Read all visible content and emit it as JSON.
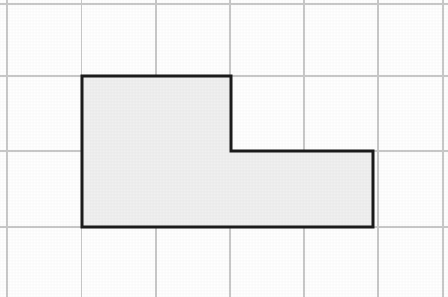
{
  "figure": {
    "canvas": {
      "width": 448,
      "height": 297
    },
    "background_color": "#ffffff"
  },
  "grid": {
    "line_color": "#c9c9c9",
    "line_width": 1.1,
    "columns": 6,
    "rows": 4,
    "cell_width": 74,
    "cell_height": 75.5,
    "origin_x": 7,
    "origin_y": 4,
    "vertical_line_x": [
      7,
      81.5,
      156,
      230,
      304,
      378,
      443
    ],
    "horizontal_line_y": [
      4,
      76,
      151,
      227
    ]
  },
  "shape": {
    "name": "l-shape-polygon",
    "fill_color": "#f0f0f0",
    "stroke_color": "#1c1c1c",
    "stroke_width": 3,
    "vertices": [
      [
        82,
        76
      ],
      [
        231,
        76
      ],
      [
        231,
        151
      ],
      [
        373,
        151
      ],
      [
        373,
        227
      ],
      [
        82,
        227
      ]
    ],
    "path": "M 82 76 L 231 76 L 231 151 L 373 151 L 373 227 L 82 227 Z",
    "grid_squares_covered": 6,
    "upper_arm_grid_units": {
      "width": 2,
      "height": 1
    },
    "lower_arm_grid_units": {
      "width": 4,
      "height": 1
    }
  }
}
